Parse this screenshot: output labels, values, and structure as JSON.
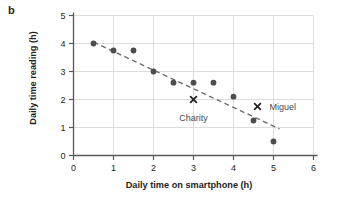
{
  "figure": {
    "panel_label": "b",
    "x_axis_title": "Daily time on smartphone (h)",
    "y_axis_title": "Daily time reading (h)"
  },
  "annotations": {
    "charity": "Charity",
    "miguel": "Miguel"
  },
  "colors": {
    "point": "#4d4d4d",
    "axis": "#58595b",
    "grid": "#d9d9d9",
    "trend": "#6d6e71",
    "text": "#231f20",
    "annotation_text": "#4c4c4c",
    "background": "#ffffff"
  },
  "chart_data": {
    "type": "scatter",
    "title": "",
    "xlabel": "Daily time on smartphone (h)",
    "ylabel": "Daily time reading (h)",
    "xlim": [
      0,
      6
    ],
    "ylim": [
      0,
      5
    ],
    "xticks": [
      0,
      1,
      2,
      3,
      4,
      5,
      6
    ],
    "yticks": [
      0,
      1,
      2,
      3,
      4,
      5
    ],
    "xtick_labels": [
      "0",
      "1",
      "2",
      "3",
      "4",
      "5",
      "6"
    ],
    "ytick_labels": [
      "0",
      "1",
      "2",
      "3",
      "4",
      "5"
    ],
    "grid": true,
    "legend": "none",
    "series": [
      {
        "name": "Students",
        "marker": "circle",
        "points": [
          {
            "x": 0.5,
            "y": 4.0
          },
          {
            "x": 1.0,
            "y": 3.75
          },
          {
            "x": 1.5,
            "y": 3.75
          },
          {
            "x": 2.0,
            "y": 3.0
          },
          {
            "x": 2.5,
            "y": 2.6
          },
          {
            "x": 3.0,
            "y": 2.6
          },
          {
            "x": 3.5,
            "y": 2.6
          },
          {
            "x": 4.0,
            "y": 2.1
          },
          {
            "x": 4.5,
            "y": 1.25
          },
          {
            "x": 5.0,
            "y": 0.5
          }
        ]
      },
      {
        "name": "Named points",
        "marker": "x",
        "points": [
          {
            "x": 3.0,
            "y": 2.0,
            "label": "Charity"
          },
          {
            "x": 4.6,
            "y": 1.75,
            "label": "Miguel"
          }
        ]
      }
    ],
    "trend_line": {
      "style": "dashed",
      "x_start": 0.5,
      "y_start": 4.05,
      "x_end": 5.15,
      "y_end": 0.95
    },
    "annotations": [
      {
        "text": "Charity",
        "x": 3.0,
        "y": 1.7
      },
      {
        "text": "Miguel",
        "x": 4.75,
        "y": 1.75
      }
    ]
  }
}
